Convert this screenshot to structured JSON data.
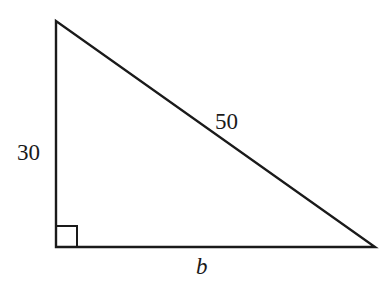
{
  "diagram": {
    "type": "right-triangle",
    "vertices": {
      "top": [
        56,
        21
      ],
      "bottom_left": [
        56,
        247
      ],
      "bottom_right": [
        375,
        247
      ]
    },
    "right_angle_at": "bottom_left",
    "labels": {
      "vertical_leg": "30",
      "hypotenuse": "50",
      "base": "b"
    },
    "stroke_color": "#1a1a1a"
  }
}
